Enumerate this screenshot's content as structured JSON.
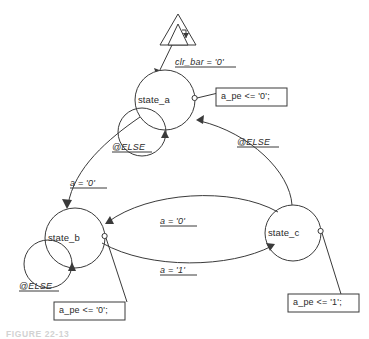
{
  "diagram": {
    "type": "state-machine-diagram",
    "caption": "FIGURE 22-13",
    "reset": {
      "symbol": "reset-triangle-icon",
      "label": "clr_bar = '0'"
    },
    "states": [
      {
        "id": "state_a",
        "label": "state_a",
        "cx": 165,
        "cy": 100,
        "r": 30
      },
      {
        "id": "state_b",
        "label": "state_b",
        "cx": 75,
        "cy": 238,
        "r": 30
      },
      {
        "id": "state_c",
        "label": "state_c",
        "cx": 293,
        "cy": 233,
        "r": 28
      }
    ],
    "transitions": [
      {
        "id": "reset-to-a",
        "from": "reset",
        "to": "state_a",
        "label": "clr_bar = '0'"
      },
      {
        "id": "a-self",
        "from": "state_a",
        "to": "state_a",
        "label": "@ELSE"
      },
      {
        "id": "a-to-b",
        "from": "state_a",
        "to": "state_b",
        "label": "a = '0'"
      },
      {
        "id": "b-self",
        "from": "state_b",
        "to": "state_b",
        "label": "@ELSE"
      },
      {
        "id": "b-to-c",
        "from": "state_b",
        "to": "state_c",
        "label": "a = '1'"
      },
      {
        "id": "c-to-b",
        "from": "state_c",
        "to": "state_b",
        "label": "a = '0'"
      },
      {
        "id": "c-to-a",
        "from": "state_c",
        "to": "state_a",
        "label": "@ELSE"
      }
    ],
    "actions": [
      {
        "id": "action-a",
        "state": "state_a",
        "text": "a_pe <= '0';"
      },
      {
        "id": "action-b",
        "state": "state_b",
        "text": "a_pe <= '0';"
      },
      {
        "id": "action-c",
        "state": "state_c",
        "text": "a_pe <= '1';"
      }
    ],
    "colors": {
      "stroke": "#3a3a3a",
      "text": "#2b2b2b",
      "background": "#ffffff",
      "caption": "#d2d2d2"
    }
  }
}
